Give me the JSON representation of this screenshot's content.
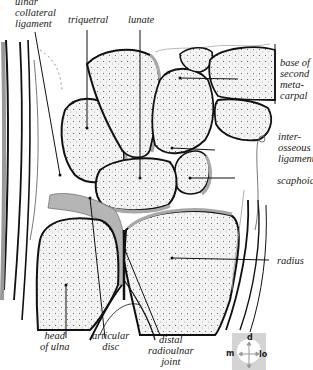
{
  "figure": {
    "labels": {
      "ulnar_collateral_ligament": "ulnar\ncollateral\nligament",
      "triquetral": "triquetral",
      "lunate": "lunate",
      "base_of_second_metacarpal": "base of\nsecond\nmeta-\ncarpal",
      "interosseous_ligament": "inter-\nosseous\nligament",
      "scaphoid": "scaphoid",
      "radius": "radius",
      "head_of_ulna": "head\nof ulna",
      "articular_disc": "articular\ndisc",
      "distal_radioulnar_joint": "distal\nradioulnar\njoint"
    },
    "orientation_key": {
      "top": "d",
      "left": "m",
      "right": "lo"
    },
    "colors": {
      "bone_fill": "#f2f2f2",
      "cartilage": "#a8a8a8",
      "outline": "#111111",
      "key_bg": "#d4d4d4"
    }
  }
}
